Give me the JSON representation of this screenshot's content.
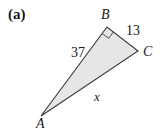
{
  "figure": {
    "part_label": "(a)",
    "vertices": {
      "A": {
        "label": "A",
        "x": 41,
        "y": 116
      },
      "B": {
        "label": "B",
        "x": 107,
        "y": 27
      },
      "C": {
        "label": "C",
        "x": 138,
        "y": 51
      }
    },
    "sides": {
      "AB": {
        "label": "37"
      },
      "BC": {
        "label": "13"
      },
      "AC": {
        "label": "x"
      }
    },
    "right_angle_at": "B",
    "colors": {
      "fill": "#e6e6e6",
      "stroke": "#3a3a3a",
      "text": "#1a1a1a"
    }
  }
}
